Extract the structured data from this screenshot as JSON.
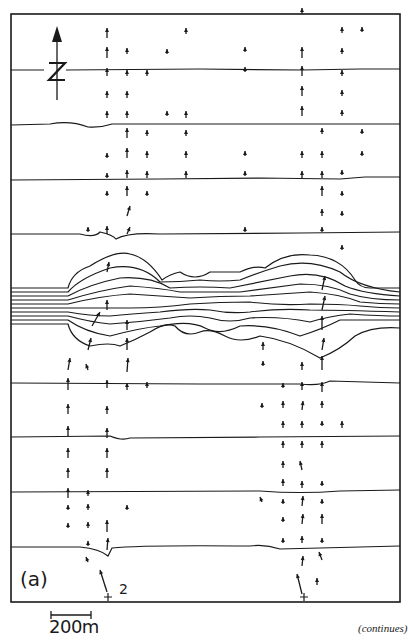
{
  "figure": {
    "panel_label": "(a)",
    "station_label": "2",
    "scale_bar": {
      "label": "200m",
      "length_m": 200
    },
    "north_arrow": {
      "label": "N",
      "icon": "north-arrow-icon"
    },
    "continuation_note": "(continues)"
  },
  "layout": {
    "frame": {
      "left": 11,
      "top": 14,
      "right": 400,
      "bottom": 602
    },
    "horizontal_lines_y": [
      70,
      125,
      180,
      234,
      383,
      437,
      492,
      547
    ],
    "contour_bundle": {
      "count": 10,
      "left_edge_y_range": [
        288,
        328
      ]
    },
    "arrow_columns_x": [
      68,
      107,
      127,
      147,
      186,
      245,
      302,
      322,
      342,
      362
    ]
  },
  "colors": {
    "ink": "#1a1a1a",
    "paper": "#ffffff"
  }
}
